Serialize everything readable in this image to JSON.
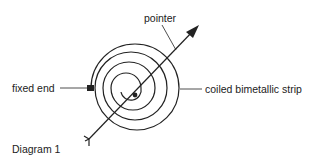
{
  "diagram": {
    "caption": "Diagram 1",
    "labels": {
      "pointer": "pointer",
      "fixed_end": "fixed end",
      "coil": "coiled bimetallic strip"
    },
    "colors": {
      "ink": "#222222",
      "background": "#ffffff"
    }
  }
}
